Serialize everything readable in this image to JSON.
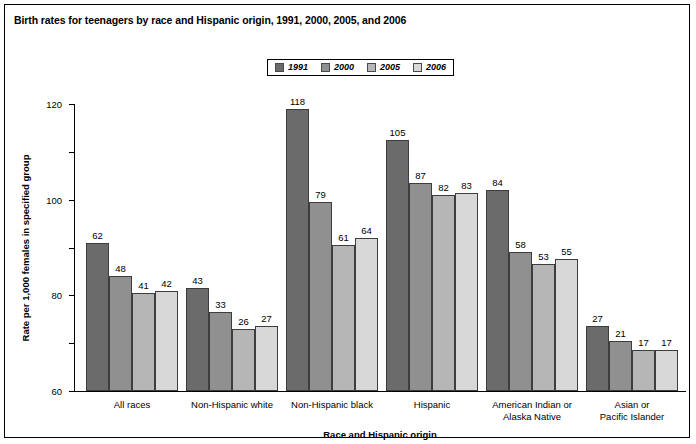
{
  "figure": {
    "title": "Birth rates for teenagers by race and Hispanic origin, 1991, 2000, 2005, and 2006",
    "border_color": "#000000",
    "background": "#ffffff"
  },
  "chart_data": {
    "type": "bar",
    "title": "Birth rates for teenagers by race and Hispanic origin, 1991, 2000, 2005, and 2006",
    "xlabel": "Race and Hispanic origin",
    "ylabel": "Rate per 1,000 females in specified group",
    "ylim": [
      0,
      120
    ],
    "yticks": [
      0,
      20,
      40,
      60,
      80,
      100,
      120
    ],
    "ytick_labels": [
      "0",
      "20",
      "40",
      "60",
      "80",
      "100",
      "120"
    ],
    "grid": false,
    "legend_position": "top-center",
    "categories": [
      "All races",
      "Non-Hispanic white",
      "Non-Hispanic black",
      "Hispanic",
      "American Indian or Alaska Native",
      "Asian or Pacific Islander"
    ],
    "category_lines": [
      [
        "All races"
      ],
      [
        "Non-Hispanic white"
      ],
      [
        "Non-Hispanic black"
      ],
      [
        "Hispanic"
      ],
      [
        "American Indian or",
        "Alaska Native"
      ],
      [
        "Asian or",
        "Pacific Islander"
      ]
    ],
    "series": [
      {
        "name": "1991",
        "color": "#6b6b6b",
        "values": [
          62,
          43,
          118,
          105,
          84,
          27
        ]
      },
      {
        "name": "2000",
        "color": "#909090",
        "values": [
          48,
          33,
          79,
          87,
          58,
          21
        ]
      },
      {
        "name": "2005",
        "color": "#b6b6b6",
        "values": [
          41,
          26,
          61,
          82,
          53,
          17
        ]
      },
      {
        "name": "2006",
        "color": "#d8d8d8",
        "values": [
          42,
          27,
          64,
          83,
          55,
          17
        ]
      }
    ]
  }
}
